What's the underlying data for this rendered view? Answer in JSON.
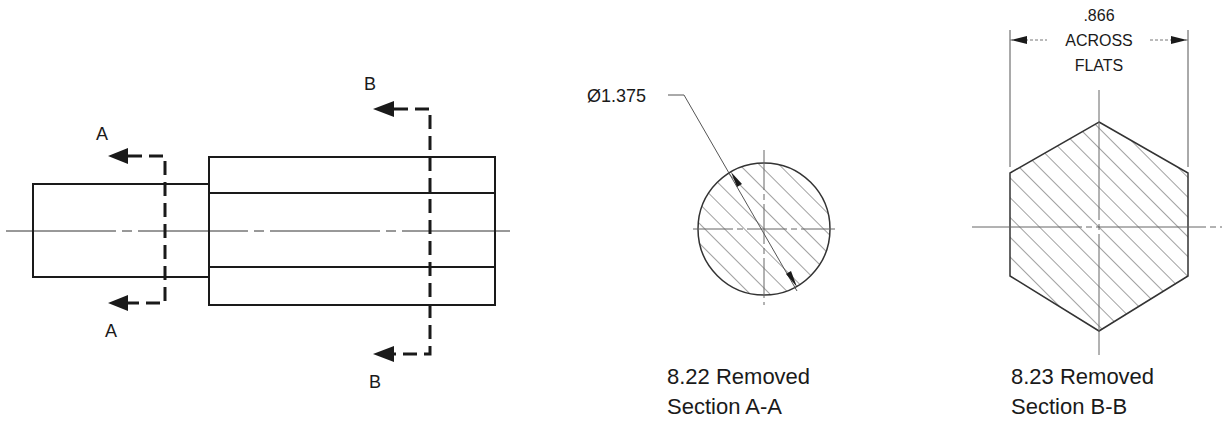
{
  "main_view": {
    "cut_a": {
      "label_top": "A",
      "label_bottom": "A"
    },
    "cut_b": {
      "label_top": "B",
      "label_bottom": "B"
    }
  },
  "section_aa": {
    "dimension": "Ø1.375",
    "caption_line1": "8.22 Removed",
    "caption_line2": "Section A-A"
  },
  "section_bb": {
    "dimension_value": ".866",
    "dimension_line2": "ACROSS",
    "dimension_line3": "FLATS",
    "caption_line1": "8.23 Removed",
    "caption_line2": "Section B-B"
  },
  "colors": {
    "line": "#1a1a1a",
    "thin": "#555555",
    "background": "#ffffff"
  }
}
